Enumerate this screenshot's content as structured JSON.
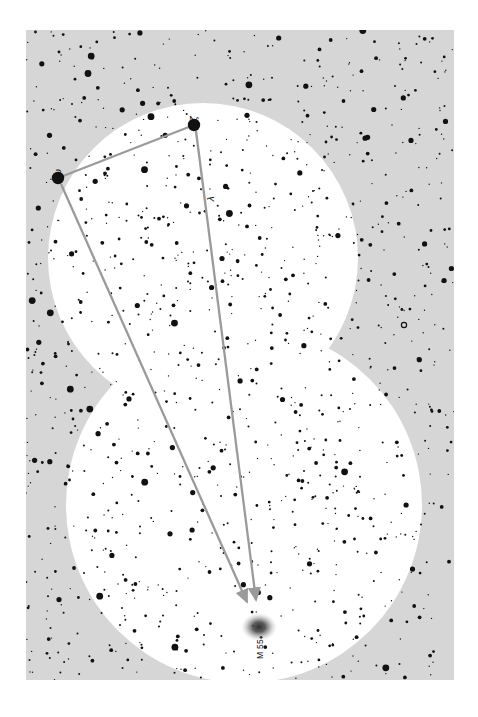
{
  "figure": {
    "kind": "star-chart",
    "orientation_note": "rotated 90 degrees; labels read bottom-to-top",
    "canvas": {
      "width": 478,
      "height": 717
    },
    "colors": {
      "page_background": "#ffffff",
      "sky_outer": "#d6d6d6",
      "sky_inner": "#ffffff",
      "star_fill": "#111111",
      "pointer_line": "#9a9a9a",
      "nebula_fill": "#3a3a3a",
      "label_text": "#111111"
    },
    "plot_area": {
      "x": 26,
      "y": 30,
      "width": 428,
      "height": 650
    }
  },
  "labels": {
    "star_a": "ζ",
    "star_b": "ω",
    "star_c": "λ",
    "deep_sky_object": "M 55"
  },
  "markers": {
    "star_a": {
      "x": 194,
      "y": 125,
      "radius": 6.2,
      "label_dx": -4,
      "label_dy": -9
    },
    "star_b": {
      "x": 58,
      "y": 178,
      "radius": 6.2,
      "label_dx": -4,
      "label_dy": -9
    },
    "star_c": {
      "x": 203,
      "y": 190,
      "radius": 0,
      "label_dx": 0,
      "label_dy": 0
    },
    "m55": {
      "x": 259,
      "y": 627,
      "radius": 11,
      "label_dx": -3,
      "label_dy": 12
    }
  },
  "pointer_lines": [
    {
      "name": "zeta-to-omega",
      "x1": 194,
      "y1": 125,
      "x2": 58,
      "y2": 178,
      "arrow": false
    },
    {
      "name": "zeta-to-m55",
      "x1": 196,
      "y1": 131,
      "x2": 256,
      "y2": 600,
      "arrow": true
    },
    {
      "name": "omega-to-m55",
      "x1": 61,
      "y1": 184,
      "x2": 247,
      "y2": 602,
      "arrow": true
    }
  ],
  "sky_shape": {
    "description": "two overlapping circular fields of view forming a figure-eight white region on a light grey background",
    "circles": [
      {
        "name": "upper-field",
        "cx": 203,
        "cy": 258,
        "r": 155
      },
      {
        "name": "lower-field",
        "cx": 244,
        "cy": 505,
        "r": 178
      }
    ]
  },
  "star_field": {
    "description": "dense scatter of point stars of varying magnitude across the whole frame",
    "magnitude_radii": [
      0.7,
      1.0,
      1.4,
      1.9,
      2.6,
      3.4
    ],
    "open_circle_star": {
      "x": 404,
      "y": 325,
      "radius": 2.6
    },
    "seed": 20240617,
    "count": 1180
  }
}
